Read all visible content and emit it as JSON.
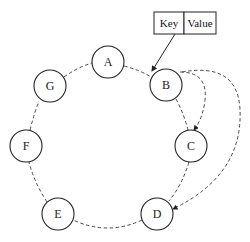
{
  "diagram": {
    "type": "consistent-hash-ring",
    "nodes": [
      {
        "id": "A",
        "label": "A",
        "cx": 108,
        "cy": 62
      },
      {
        "id": "B",
        "label": "B",
        "cx": 166,
        "cy": 85
      },
      {
        "id": "C",
        "label": "C",
        "cx": 191,
        "cy": 146
      },
      {
        "id": "D",
        "label": "D",
        "cx": 157,
        "cy": 214
      },
      {
        "id": "E",
        "label": "E",
        "cx": 58,
        "cy": 214
      },
      {
        "id": "F",
        "label": "F",
        "cx": 26,
        "cy": 146
      },
      {
        "id": "G",
        "label": "G",
        "cx": 50,
        "cy": 86
      }
    ],
    "ring_order": [
      "A",
      "B",
      "C",
      "D",
      "E",
      "F",
      "G"
    ],
    "key_value_box": {
      "key_label": "Key",
      "value_label": "Value"
    },
    "arrows": [
      {
        "from": "Key/Value",
        "to": "B",
        "style": "solid"
      },
      {
        "from": "B",
        "to": "C",
        "style": "dashed"
      },
      {
        "from": "B",
        "to": "D",
        "style": "dashed"
      }
    ]
  }
}
